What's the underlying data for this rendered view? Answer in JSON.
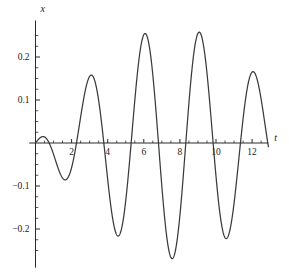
{
  "chart_data": {
    "type": "line",
    "title": "",
    "xlabel": "t",
    "ylabel": "x",
    "xlim": [
      -0.35,
      12.9
    ],
    "ylim": [
      -0.29,
      0.285
    ],
    "grid": false,
    "legend": null,
    "x_ticks_major": [
      2,
      4,
      6,
      8,
      10,
      12
    ],
    "x_tick_labels": [
      "2",
      "4",
      "6",
      "8",
      "10",
      "12"
    ],
    "x_ticks_minor": [
      0.5,
      1,
      1.5,
      2.5,
      3,
      3.5,
      4.5,
      5,
      5.5,
      6.5,
      7,
      7.5,
      8.5,
      9,
      9.5,
      10.5,
      11,
      11.5,
      12.5
    ],
    "y_ticks_major": [
      -0.2,
      -0.1,
      0.1,
      0.2
    ],
    "y_tick_labels": [
      "-0.2",
      "-0.1",
      "0.1",
      "0.2"
    ],
    "y_ticks_minor": [
      -0.25,
      -0.225,
      -0.175,
      -0.15,
      -0.125,
      -0.075,
      -0.05,
      -0.025,
      0.025,
      0.05,
      0.075,
      0.125,
      0.15,
      0.175,
      0.225,
      0.25
    ],
    "series": [
      {
        "name": "x(t)",
        "color": "#3a3a3a",
        "description": "Beating / near-resonant oscillation starting at the origin; first crest is smaller, later crests are of equal height.",
        "x": [
          0,
          0.15,
          0.3,
          0.45,
          0.6,
          0.75,
          0.9,
          1.05,
          1.2,
          1.35,
          1.5,
          1.65,
          1.8,
          1.95,
          2.1,
          2.25,
          2.4,
          2.55,
          2.7,
          2.85,
          3,
          3.15,
          3.3,
          3.45,
          3.6,
          3.75,
          3.9,
          4.05,
          4.2,
          4.35,
          4.5,
          4.65,
          4.8,
          4.95,
          5.1,
          5.25,
          5.4,
          5.55,
          5.7,
          5.85,
          6,
          6.15,
          6.3,
          6.45,
          6.6,
          6.75,
          6.9,
          7.05,
          7.2,
          7.35,
          7.5,
          7.65,
          7.8,
          7.95,
          8.1,
          8.25,
          8.4,
          8.55,
          8.7,
          8.85,
          9,
          9.15,
          9.3,
          9.45,
          9.6,
          9.75,
          9.9,
          10.05,
          10.2,
          10.35,
          10.5,
          10.65,
          10.8,
          10.95,
          11.1,
          11.25,
          11.4,
          11.55,
          11.7,
          11.85,
          12,
          12.15,
          12.3,
          12.45,
          12.6
        ],
        "y": [
          0,
          0.032,
          0.066,
          0.1,
          0.13,
          0.154,
          0.17,
          0.176,
          0.172,
          0.157,
          0.132,
          0.098,
          0.057,
          0.011,
          -0.037,
          -0.085,
          -0.13,
          -0.17,
          -0.203,
          -0.228,
          -0.245,
          -0.254,
          -0.254,
          -0.245,
          -0.228,
          -0.203,
          -0.17,
          -0.13,
          -0.085,
          -0.037,
          0.011,
          0.057,
          0.098,
          0.132,
          0.157,
          0.172,
          0.176,
          0.17,
          0.154,
          0.13,
          0.1,
          0.066,
          0.032,
          0,
          -0.032,
          -0.066,
          -0.1,
          -0.13,
          -0.154,
          -0.17,
          -0.176,
          -0.172,
          -0.157,
          -0.132,
          -0.098,
          -0.057,
          -0.011,
          0.037,
          0.085,
          0.13,
          0.17,
          0.203,
          0.228,
          0.245,
          0.254,
          0.254,
          0.245,
          0.228,
          0.203,
          0.17,
          0.13,
          0.085,
          0.037,
          -0.011,
          -0.057,
          -0.098,
          -0.132,
          -0.157,
          -0.172,
          -0.176,
          -0.17,
          -0.154,
          -0.13,
          -0.1,
          -0.066
        ],
        "peaks": [
          {
            "t": 1.05,
            "x": 0.176
          },
          {
            "t": 4.0,
            "x": 0.265
          },
          {
            "t": 6.75,
            "x": 0.267
          },
          {
            "t": 10.2,
            "x": 0.267
          }
        ],
        "troughs": [
          {
            "t": 2.5,
            "x": -0.258
          },
          {
            "t": 5.45,
            "x": -0.262
          },
          {
            "t": 8.7,
            "x": -0.262
          },
          {
            "t": 11.9,
            "x": -0.258
          }
        ],
        "zero_crossings": [
          0,
          1.85,
          3.2,
          4.7,
          6.4,
          7.9,
          9.5,
          11.05
        ]
      }
    ]
  },
  "axes": {
    "x_axis_label": "t",
    "y_axis_label": "x"
  },
  "colors": {
    "background": "#ffffff",
    "axis": "#2b2b2b",
    "curve": "#3a3a3a",
    "text": "#1a1a1a"
  }
}
